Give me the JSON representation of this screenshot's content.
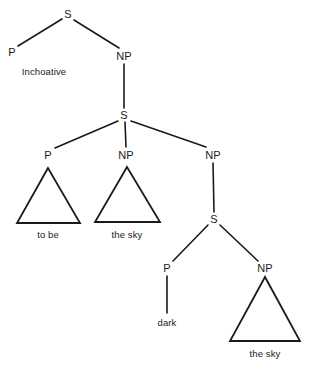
{
  "diagram": {
    "type": "syntax-tree",
    "background_color": "#ffffff",
    "line_color": "#1a1a1a",
    "nodes": [
      {
        "id": "s-root",
        "label": "S",
        "x": 68,
        "y": 14
      },
      {
        "id": "p-top",
        "label": "P",
        "x": 12,
        "y": 52
      },
      {
        "id": "np-top",
        "label": "NP",
        "x": 124,
        "y": 56
      },
      {
        "id": "s-mid",
        "label": "S",
        "x": 124,
        "y": 115
      },
      {
        "id": "p-mid",
        "label": "P",
        "x": 48,
        "y": 155
      },
      {
        "id": "np-mid",
        "label": "NP",
        "x": 126,
        "y": 155
      },
      {
        "id": "np-right",
        "label": "NP",
        "x": 213,
        "y": 155
      },
      {
        "id": "s-low",
        "label": "S",
        "x": 214,
        "y": 219
      },
      {
        "id": "p-low",
        "label": "P",
        "x": 167,
        "y": 268
      },
      {
        "id": "np-low",
        "label": "NP",
        "x": 265,
        "y": 268
      }
    ],
    "terminals": [
      {
        "id": "inchoative",
        "label": "Inchoative",
        "x": 44,
        "y": 71
      },
      {
        "id": "to-be",
        "label": "to be",
        "x": 48,
        "y": 234
      },
      {
        "id": "the-sky-mid",
        "label": "the sky",
        "x": 127,
        "y": 234
      },
      {
        "id": "dark",
        "label": "dark",
        "x": 167,
        "y": 322
      },
      {
        "id": "the-sky-low",
        "label": "the sky",
        "x": 265,
        "y": 353
      }
    ],
    "branches": [
      {
        "id": "s-root-to-p-top",
        "x1": 62,
        "y1": 19,
        "x2": 18,
        "y2": 46
      },
      {
        "id": "s-root-to-np-top",
        "x1": 74,
        "y1": 20,
        "x2": 119,
        "y2": 48
      },
      {
        "id": "np-top-to-s-mid",
        "x1": 124,
        "y1": 64,
        "x2": 124,
        "y2": 108
      },
      {
        "id": "s-mid-to-p-mid",
        "x1": 118,
        "y1": 121,
        "x2": 55,
        "y2": 148
      },
      {
        "id": "s-mid-to-np-mid",
        "x1": 125,
        "y1": 122,
        "x2": 126,
        "y2": 147
      },
      {
        "id": "s-mid-to-np-right",
        "x1": 131,
        "y1": 121,
        "x2": 206,
        "y2": 147
      },
      {
        "id": "np-right-to-s-low",
        "x1": 213,
        "y1": 163,
        "x2": 214,
        "y2": 212
      },
      {
        "id": "s-low-to-p-low",
        "x1": 208,
        "y1": 225,
        "x2": 173,
        "y2": 261
      },
      {
        "id": "s-low-to-np-low",
        "x1": 220,
        "y1": 225,
        "x2": 258,
        "y2": 261
      },
      {
        "id": "p-low-to-dark",
        "x1": 167,
        "y1": 276,
        "x2": 167,
        "y2": 313
      }
    ],
    "triangles": [
      {
        "id": "triangle-to-be",
        "apex_x": 48,
        "apex_y": 168,
        "left_x": 17,
        "right_x": 80,
        "base_y": 223
      },
      {
        "id": "triangle-the-sky-mid",
        "apex_x": 127,
        "apex_y": 167,
        "left_x": 95,
        "right_x": 160,
        "base_y": 222
      },
      {
        "id": "triangle-the-sky-low",
        "apex_x": 265,
        "apex_y": 277,
        "left_x": 230,
        "right_x": 300,
        "base_y": 341
      }
    ]
  }
}
